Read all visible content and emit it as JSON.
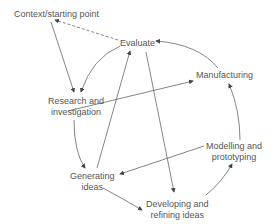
{
  "diagram": {
    "nodes": {
      "context": "Context/starting point",
      "evaluate": "Evaluate",
      "manufacturing": "Manufacturing",
      "research_1": "Research and",
      "research_2": "investigation",
      "generating_1": "Generating",
      "generating_2": "ideas",
      "modelling_1": "Modelling and",
      "modelling_2": "prototyping",
      "developing_1": "Developing and",
      "developing_2": "refining ideas"
    },
    "edges": [
      {
        "from": "Evaluate",
        "to": "Context/starting point",
        "style": "dashed"
      },
      {
        "from": "Context/starting point",
        "to": "Research and investigation",
        "style": "solid"
      },
      {
        "from": "Evaluate",
        "to": "Research and investigation",
        "style": "solid"
      },
      {
        "from": "Research and investigation",
        "to": "Generating ideas",
        "style": "solid"
      },
      {
        "from": "Research and investigation",
        "to": "Manufacturing",
        "style": "solid"
      },
      {
        "from": "Generating ideas",
        "to": "Evaluate",
        "style": "solid"
      },
      {
        "from": "Generating ideas",
        "to": "Developing and refining ideas",
        "style": "solid"
      },
      {
        "from": "Evaluate",
        "to": "Developing and refining ideas",
        "style": "solid"
      },
      {
        "from": "Developing and refining ideas",
        "to": "Modelling and prototyping",
        "style": "solid"
      },
      {
        "from": "Modelling and prototyping",
        "to": "Generating ideas",
        "style": "solid"
      },
      {
        "from": "Modelling and prototyping",
        "to": "Manufacturing",
        "style": "solid"
      },
      {
        "from": "Manufacturing",
        "to": "Evaluate",
        "style": "solid"
      }
    ],
    "colors": {
      "line": "#555555",
      "text": "#555555"
    }
  }
}
